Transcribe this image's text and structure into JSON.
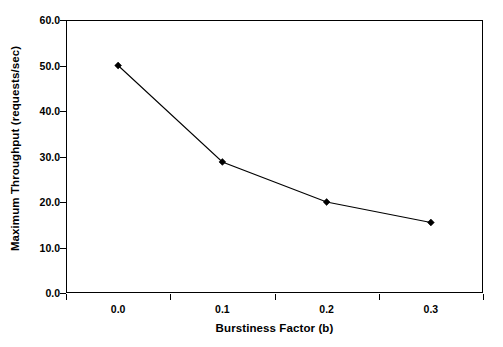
{
  "chart_data": {
    "type": "line",
    "title": "",
    "xlabel": "Burstiness Factor (b)",
    "ylabel": "Maximum Throughput (requests/sec)",
    "categories": [
      "0.0",
      "0.1",
      "0.2",
      "0.3"
    ],
    "x": [
      0.0,
      0.1,
      0.2,
      0.3
    ],
    "values": [
      50.0,
      28.8,
      20.0,
      15.5
    ],
    "series": [
      {
        "name": "Maximum Throughput",
        "values": [
          50.0,
          28.8,
          20.0,
          15.5
        ],
        "color": "#000000",
        "marker": "diamond",
        "line_style": "solid"
      }
    ],
    "ylim": [
      0.0,
      60.0
    ],
    "yticks": [
      "0.0",
      "10.0",
      "20.0",
      "30.0",
      "40.0",
      "50.0",
      "60.0"
    ],
    "ytick_values": [
      0.0,
      10.0,
      20.0,
      30.0,
      40.0,
      50.0,
      60.0
    ],
    "xticks": [
      "0.0",
      "0.1",
      "0.2",
      "0.3"
    ],
    "grid": false,
    "legend": false,
    "legend_position": "none",
    "background": "#ffffff",
    "frame_color": "#000000"
  },
  "axes": {
    "y_title": "Maximum Throughput (requests/sec)",
    "x_title": "Burstiness Factor (b)"
  }
}
